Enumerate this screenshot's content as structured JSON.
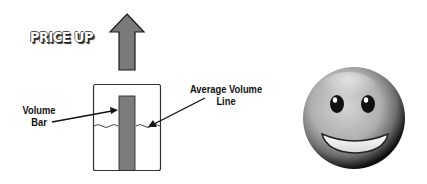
{
  "diagram": {
    "headline": "PRICE UP",
    "labels": {
      "volume_bar_line1": "Volume",
      "volume_bar_line2": "Bar",
      "average_volume_line1": "Average Volume",
      "average_volume_line2": "Line"
    },
    "icons": {
      "price_arrow": "up-arrow-icon",
      "sentiment": "smiley-face-icon"
    },
    "colors": {
      "arrow_fill": "#7a7a7a",
      "bar_fill": "#7c7c7c",
      "outline": "#1a1a1a",
      "face_gray": "#b5b5b5"
    }
  }
}
